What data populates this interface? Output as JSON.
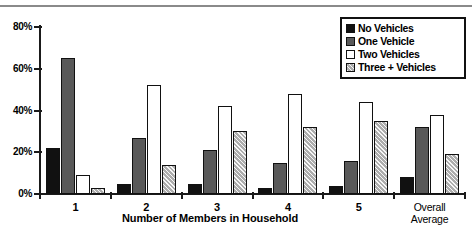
{
  "chart_data": {
    "type": "bar",
    "title": "",
    "xlabel": "Number of Members in Household",
    "ylabel": "",
    "categories": [
      "1",
      "2",
      "3",
      "4",
      "5",
      "Overall Average"
    ],
    "series": [
      {
        "name": "No Vehicles",
        "color": "#111111",
        "values": [
          22,
          5,
          5,
          3,
          4,
          8
        ]
      },
      {
        "name": "One Vehicle",
        "color": "#595959",
        "values": [
          65,
          27,
          21,
          15,
          16,
          32
        ]
      },
      {
        "name": "Two Vehicles",
        "color": "#ffffff",
        "values": [
          9,
          52,
          42,
          48,
          44,
          38
        ]
      },
      {
        "name": "Three + Vehicles",
        "color": "#c9c9c9",
        "values": [
          3,
          14,
          30,
          32,
          35,
          19
        ]
      }
    ],
    "ylim": [
      0,
      80
    ],
    "ytick_labels": [
      "0%",
      "20%",
      "40%",
      "60%",
      "80%"
    ],
    "ytick_values": [
      0,
      20,
      40,
      60,
      80
    ],
    "grid": false,
    "legend_position": "top-right"
  },
  "axis": {
    "y_ticks": [
      {
        "label": "80%",
        "value": 80
      },
      {
        "label": "60%",
        "value": 60
      },
      {
        "label": "40%",
        "value": 40
      },
      {
        "label": "20%",
        "value": 20
      },
      {
        "label": "0%",
        "value": 0
      }
    ],
    "x_title": "Number of Members in Household",
    "x_categories": [
      {
        "line1": "1",
        "line2": ""
      },
      {
        "line1": "2",
        "line2": ""
      },
      {
        "line1": "3",
        "line2": ""
      },
      {
        "line1": "4",
        "line2": ""
      },
      {
        "line1": "5",
        "line2": ""
      },
      {
        "line1": "Overall",
        "line2": "Average"
      }
    ]
  },
  "legend": {
    "items": [
      {
        "label": "No Vehicles",
        "swatch": "black-swatch"
      },
      {
        "label": "One Vehicle",
        "swatch": "dark-gray-swatch"
      },
      {
        "label": "Two Vehicles",
        "swatch": "white-swatch"
      },
      {
        "label": "Three + Vehicles",
        "swatch": "light-gray-hatched-swatch"
      }
    ]
  }
}
